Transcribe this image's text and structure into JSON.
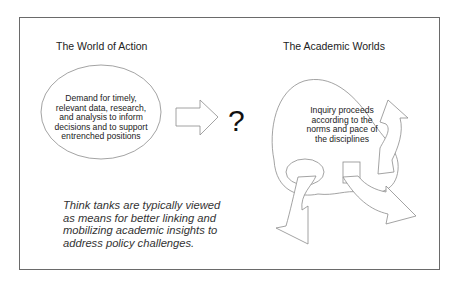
{
  "diagram": {
    "left_panel": {
      "title": "The World of Action",
      "ellipse_text": "Demand for timely, relevant data, research, and analysis to inform decisions and to support entrenched positions",
      "ellipse_lines": [
        "Demand for timely,",
        "relevant data, research,",
        "and analysis to inform",
        "decisions and to support",
        "entrenched positions"
      ]
    },
    "connector": {
      "arrow_icon": "block-arrow-right",
      "question_mark": "?"
    },
    "right_panel": {
      "title": "The Academic Worlds",
      "blob_lines": [
        "Inquiry proceeds",
        "according to the",
        "norms and pace of",
        "the disciplines"
      ],
      "arrows": [
        "curved-arrow-up-right",
        "curved-arrow-down-left",
        "curved-arrow-down-right"
      ]
    },
    "note_lines": [
      "Think tanks are typically viewed",
      "as means for better linking and",
      "mobilizing academic insights to",
      "address policy challenges."
    ],
    "colors": {
      "frame_border": "#6a6a6a",
      "shape_stroke": "#8c8c8c",
      "text": "#222222"
    }
  }
}
